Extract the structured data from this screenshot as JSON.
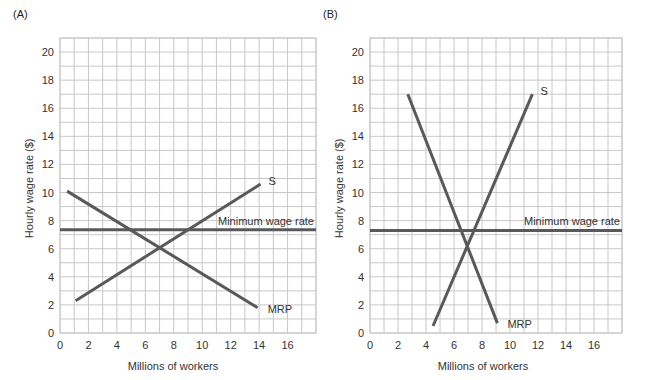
{
  "chart_data": [
    {
      "type": "line",
      "panel_label": "(A)",
      "title": "",
      "xlabel": "Millions of workers",
      "ylabel": "Hourly wage rate ($)",
      "xlim": [
        0,
        18
      ],
      "ylim": [
        0,
        21
      ],
      "x_ticks": [
        0,
        2,
        4,
        6,
        8,
        10,
        12,
        14,
        16
      ],
      "y_ticks": [
        0,
        2,
        4,
        6,
        8,
        10,
        12,
        14,
        16,
        18,
        20
      ],
      "grid": true,
      "series": [
        {
          "name": "MRP",
          "points": [
            [
              0.5,
              10.1
            ],
            [
              13.9,
              1.8
            ]
          ],
          "color": "#595959"
        },
        {
          "name": "S",
          "points": [
            [
              1.1,
              2.3
            ],
            [
              14.1,
              10.6
            ]
          ],
          "color": "#595959"
        },
        {
          "name": "Minimum wage rate",
          "points": [
            [
              0,
              7.35
            ],
            [
              18,
              7.35
            ]
          ],
          "color": "#595959"
        }
      ],
      "annotations": [
        "S",
        "MRP",
        "Minimum wage rate"
      ]
    },
    {
      "type": "line",
      "panel_label": "(B)",
      "title": "",
      "xlabel": "Millions of workers",
      "ylabel": "Hourly wage rate ($)",
      "xlim": [
        0,
        18
      ],
      "ylim": [
        0,
        21
      ],
      "x_ticks": [
        0,
        2,
        4,
        6,
        8,
        10,
        12,
        14,
        16
      ],
      "y_ticks": [
        0,
        2,
        4,
        6,
        8,
        10,
        12,
        14,
        16,
        18,
        20
      ],
      "grid": true,
      "series": [
        {
          "name": "MRP",
          "points": [
            [
              2.7,
              17
            ],
            [
              9.1,
              0.7
            ]
          ],
          "color": "#595959"
        },
        {
          "name": "S",
          "points": [
            [
              4.5,
              0.5
            ],
            [
              11.6,
              17
            ]
          ],
          "color": "#595959"
        },
        {
          "name": "Minimum wage rate",
          "points": [
            [
              0,
              7.3
            ],
            [
              18,
              7.3
            ]
          ],
          "color": "#595959"
        }
      ],
      "annotations": [
        "S",
        "MRP",
        "Minimum wage rate"
      ]
    }
  ]
}
